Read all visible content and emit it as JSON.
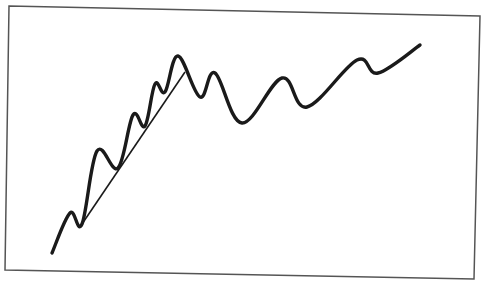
{
  "chart_data": {
    "type": "line",
    "title": "",
    "xlabel": "",
    "ylabel": "",
    "grid": false,
    "legend": null,
    "series": [
      {
        "name": "price",
        "points": [
          [
            52,
            253
          ],
          [
            70,
            213
          ],
          [
            82,
            224
          ],
          [
            97,
            151
          ],
          [
            118,
            168
          ],
          [
            133,
            115
          ],
          [
            145,
            126
          ],
          [
            155,
            84
          ],
          [
            165,
            92
          ],
          [
            178,
            56
          ],
          [
            200,
            97
          ],
          [
            215,
            73
          ],
          [
            242,
            123
          ],
          [
            282,
            78
          ],
          [
            307,
            107
          ],
          [
            357,
            60
          ],
          [
            378,
            73
          ],
          [
            420,
            45
          ]
        ]
      },
      {
        "name": "trendline",
        "points": [
          [
            82,
            224
          ],
          [
            185,
            72
          ]
        ]
      }
    ],
    "frame": [
      [
        9,
        6
      ],
      [
        480,
        16
      ],
      [
        474,
        279
      ],
      [
        5,
        270
      ]
    ],
    "colors": {
      "line": "#1a1a1a",
      "frame": "#555555",
      "background": "#ffffff"
    }
  }
}
